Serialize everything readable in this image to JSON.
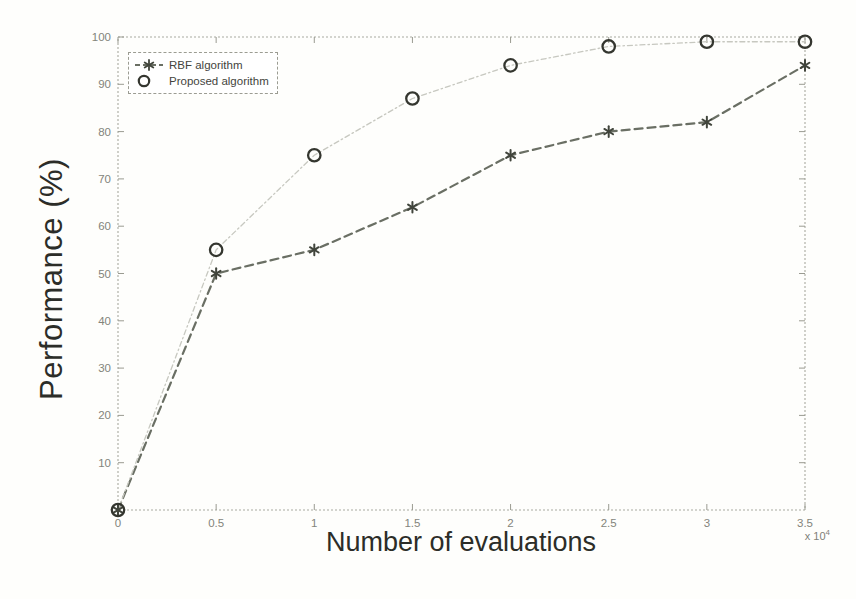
{
  "chart_data": {
    "type": "line",
    "title": "",
    "xlabel": "Number of evaluations",
    "ylabel": "Performance (%)",
    "x_scale_prefix": "x 10",
    "x_scale_exponent": "4",
    "xlim": [
      0,
      3.5
    ],
    "ylim": [
      0,
      100
    ],
    "x": [
      0,
      0.5,
      1,
      1.5,
      2,
      2.5,
      3,
      3.5
    ],
    "x_ticks": [
      "0",
      "0.5",
      "1",
      "1.5",
      "2",
      "2.5",
      "3",
      "3.5"
    ],
    "y_ticks": [
      "10",
      "20",
      "30",
      "40",
      "50",
      "60",
      "70",
      "80",
      "90",
      "100"
    ],
    "grid": false,
    "legend": {
      "position": "top-left"
    },
    "series": [
      {
        "name": "RBF algorithm",
        "marker": "asterisk",
        "line_style": "dashed",
        "line_color": "#6a6f64",
        "marker_color": "#41453c",
        "values": [
          0,
          50,
          55,
          64,
          75,
          80,
          82,
          94
        ]
      },
      {
        "name": "Proposed algorithm",
        "marker": "circle",
        "line_style": "dash-dot",
        "line_color": "#c7c8c0",
        "marker_color": "#34362f",
        "values": [
          0,
          55,
          75,
          87,
          94,
          98,
          99,
          99
        ]
      }
    ],
    "axis_color": "#a8a99f",
    "tick_color": "#9a9b91",
    "tick_label_color": "#83847b",
    "label_color": "#2c2d28"
  }
}
